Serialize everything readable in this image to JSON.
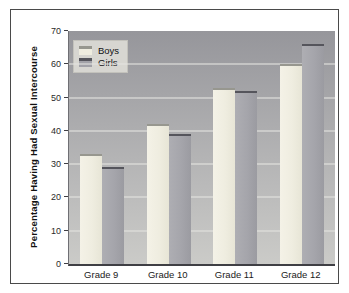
{
  "window": {
    "background": "#ffffff",
    "frame_border_color": "#4a4a4a"
  },
  "chart_data": {
    "type": "bar",
    "title": "",
    "xlabel": "",
    "ylabel": "Percentage Having Had Sexual Intercourse",
    "categories": [
      "Grade 9",
      "Grade 10",
      "Grade 11",
      "Grade 12"
    ],
    "series": [
      {
        "name": "Boys",
        "values": [
          33,
          42,
          53,
          60
        ],
        "color": "#efede0",
        "cap_color": "#97978f"
      },
      {
        "name": "Girls",
        "values": [
          29,
          39,
          52,
          66
        ],
        "color": "#a5a5ab",
        "cap_color": "#55555c"
      }
    ],
    "ylim": [
      0,
      70
    ],
    "yticks": [
      0,
      10,
      20,
      30,
      40,
      50,
      60,
      70
    ],
    "grid": true,
    "legend_position": "top-left",
    "plot_bg_top": "#96969b",
    "plot_bg_bottom": "#cbcbc8"
  }
}
